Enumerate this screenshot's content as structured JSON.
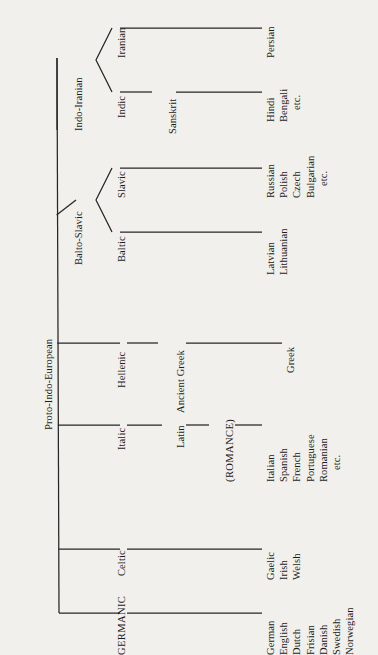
{
  "figure": {
    "type": "tree-diagram",
    "orientation": "rotated-90-ccw",
    "background_color": "#f2f0ec",
    "ink_color": "#262626"
  },
  "root": {
    "label": "Proto-Indo-European"
  },
  "branches": {
    "germanic": {
      "label": "GERMANIC"
    },
    "celtic": {
      "label": "Celtic"
    },
    "italic": {
      "label": "Italic"
    },
    "latin": {
      "label": "Latin"
    },
    "romance": {
      "label": "(ROMANCE)"
    },
    "hellenic": {
      "label": "Hellenic"
    },
    "ancient_greek": {
      "label": "Ancient Greek"
    },
    "balto_slavic": {
      "label": "Balto-Slavic"
    },
    "baltic": {
      "label": "Baltic"
    },
    "slavic": {
      "label": "Slavic"
    },
    "indo_iranian": {
      "label": "Indo-Iranian"
    },
    "indic": {
      "label": "Indic"
    },
    "sanskrit": {
      "label": "Sanskrit"
    },
    "iranian": {
      "label": "Iranian"
    }
  },
  "leaves": {
    "germanic": [
      "German",
      "English",
      "Dutch",
      "Frisian",
      "Danish",
      "Swedish",
      "Norwegian"
    ],
    "celtic": [
      "Gaelic",
      "Irish",
      "Welsh"
    ],
    "romance": [
      "Italian",
      "Spanish",
      "French",
      "Portuguese",
      "Romanian",
      "etc."
    ],
    "greek": [
      "Greek"
    ],
    "baltic": [
      "Latvian",
      "Lithuanian"
    ],
    "slavic": [
      "Russian",
      "Polish",
      "Czech",
      "Bulgarian",
      "etc."
    ],
    "indic": [
      "Hindi",
      "Bengali",
      "etc."
    ],
    "iranian": [
      "Persian"
    ]
  },
  "tree_structure": {
    "name": "Proto-Indo-European",
    "children": [
      {
        "name": "GERMANIC",
        "children": [
          {
            "name": "German"
          },
          {
            "name": "English"
          },
          {
            "name": "Dutch"
          },
          {
            "name": "Frisian"
          },
          {
            "name": "Danish"
          },
          {
            "name": "Swedish"
          },
          {
            "name": "Norwegian"
          }
        ]
      },
      {
        "name": "Celtic",
        "children": [
          {
            "name": "Gaelic"
          },
          {
            "name": "Irish"
          },
          {
            "name": "Welsh"
          }
        ]
      },
      {
        "name": "Italic",
        "children": [
          {
            "name": "Latin",
            "children": [
              {
                "name": "(ROMANCE)",
                "children": [
                  {
                    "name": "Italian"
                  },
                  {
                    "name": "Spanish"
                  },
                  {
                    "name": "French"
                  },
                  {
                    "name": "Portuguese"
                  },
                  {
                    "name": "Romanian"
                  },
                  {
                    "name": "etc."
                  }
                ]
              }
            ]
          }
        ]
      },
      {
        "name": "Hellenic",
        "children": [
          {
            "name": "Ancient Greek",
            "children": [
              {
                "name": "Greek"
              }
            ]
          }
        ]
      },
      {
        "name": "Balto-Slavic",
        "children": [
          {
            "name": "Baltic",
            "children": [
              {
                "name": "Latvian"
              },
              {
                "name": "Lithuanian"
              }
            ]
          },
          {
            "name": "Slavic",
            "children": [
              {
                "name": "Russian"
              },
              {
                "name": "Polish"
              },
              {
                "name": "Czech"
              },
              {
                "name": "Bulgarian"
              },
              {
                "name": "etc."
              }
            ]
          }
        ]
      },
      {
        "name": "Indo-Iranian",
        "children": [
          {
            "name": "Indic",
            "children": [
              {
                "name": "Sanskrit",
                "children": [
                  {
                    "name": "Hindi"
                  },
                  {
                    "name": "Bengali"
                  },
                  {
                    "name": "etc."
                  }
                ]
              }
            ]
          },
          {
            "name": "Iranian",
            "children": [
              {
                "name": "Persian"
              }
            ]
          }
        ]
      }
    ]
  }
}
